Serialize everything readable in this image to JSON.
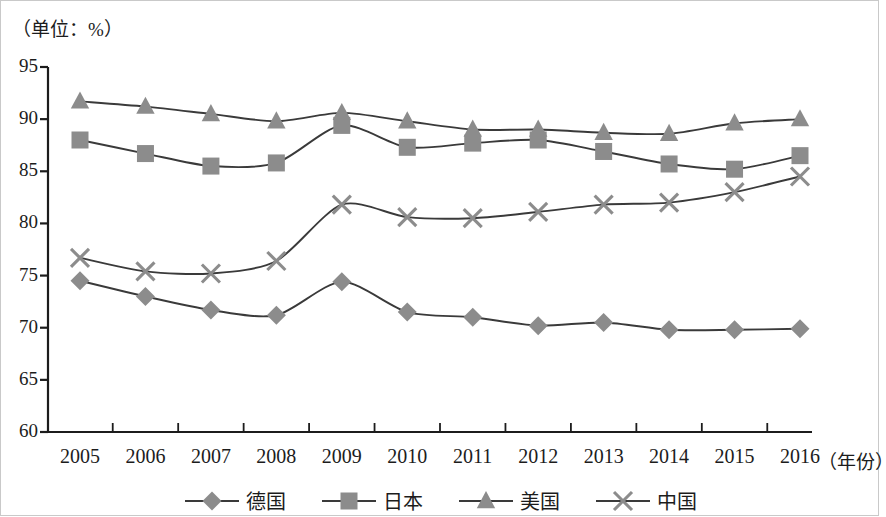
{
  "unit_label": "（单位：%）",
  "axis_title_x": "（年份）",
  "colors": {
    "marker": "#8c8c8c",
    "line": "#3a3a3a",
    "axis": "#1c1c1c",
    "text": "#1c1c1c"
  },
  "legend": {
    "items": [
      {
        "label": "德国",
        "marker": "diamond"
      },
      {
        "label": "日本",
        "marker": "square"
      },
      {
        "label": "美国",
        "marker": "triangle"
      },
      {
        "label": "中国",
        "marker": "cross"
      }
    ]
  },
  "chart_data": {
    "type": "line",
    "title": "",
    "subtitle": "",
    "xlabel": "（年份）",
    "ylabel": "（单位：%）",
    "grid": false,
    "legend_position": "bottom",
    "categories": [
      "2005",
      "2006",
      "2007",
      "2008",
      "2009",
      "2010",
      "2011",
      "2012",
      "2013",
      "2014",
      "2015",
      "2016"
    ],
    "x": [
      2005,
      2006,
      2007,
      2008,
      2009,
      2010,
      2011,
      2012,
      2013,
      2014,
      2015,
      2016
    ],
    "xlim": [
      2005,
      2016
    ],
    "ylim": [
      60,
      95
    ],
    "yticks": [
      60,
      65,
      70,
      75,
      80,
      85,
      90,
      95
    ],
    "ytick_labels": [
      "60",
      "65",
      "70",
      "75",
      "80",
      "85",
      "90",
      "95"
    ],
    "series": [
      {
        "name": "德国",
        "marker": "diamond",
        "values": [
          74.5,
          73.0,
          71.7,
          71.2,
          74.4,
          71.5,
          71.0,
          70.2,
          70.5,
          69.8,
          69.8,
          69.9
        ]
      },
      {
        "name": "日本",
        "marker": "square",
        "values": [
          88.0,
          86.7,
          85.5,
          85.8,
          89.4,
          87.3,
          87.7,
          88.0,
          86.9,
          85.7,
          85.2,
          86.5
        ]
      },
      {
        "name": "美国",
        "marker": "triangle",
        "values": [
          91.7,
          91.2,
          90.5,
          89.8,
          90.6,
          89.8,
          89.0,
          89.0,
          88.7,
          88.6,
          89.6,
          90.0
        ]
      },
      {
        "name": "中国",
        "marker": "cross",
        "values": [
          76.7,
          75.4,
          75.2,
          76.4,
          81.8,
          80.6,
          80.5,
          81.1,
          81.8,
          82.0,
          83.0,
          84.5
        ]
      }
    ]
  }
}
